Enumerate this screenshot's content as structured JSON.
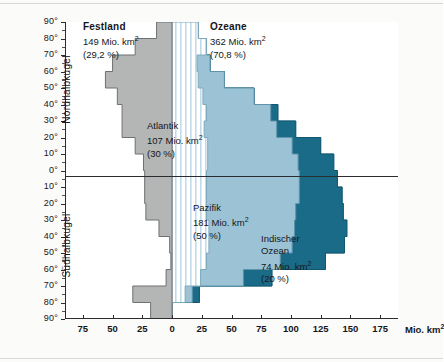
{
  "chart_data": {
    "type": "bar",
    "title": "",
    "orientation": "horizontal-back-to-back",
    "xlabel": "Mio. km2",
    "ylabel": "",
    "xlim": [
      -90,
      190
    ],
    "x_ticks": [
      {
        "value": -75,
        "label": "75"
      },
      {
        "value": -50,
        "label": "50"
      },
      {
        "value": -25,
        "label": "25"
      },
      {
        "value": 0,
        "label": "0"
      },
      {
        "value": 25,
        "label": "25"
      },
      {
        "value": 50,
        "label": "50"
      },
      {
        "value": 75,
        "label": "75"
      },
      {
        "value": 100,
        "label": "100"
      },
      {
        "value": 125,
        "label": "125"
      },
      {
        "value": 150,
        "label": "150"
      },
      {
        "value": 175,
        "label": "175"
      }
    ],
    "y_axis_label_unit": "degrees latitude",
    "y_ticks_north": [
      "90°",
      "80°",
      "70°",
      "60°",
      "50°",
      "40°",
      "30°",
      "20°",
      "10°",
      "0°"
    ],
    "y_ticks_south": [
      "10°",
      "20°",
      "30°",
      "40°",
      "50°",
      "60°",
      "70°",
      "80°",
      "90°"
    ],
    "bands": [
      {
        "lat_from": 90,
        "lat_to": 80,
        "land": 13,
        "atlantic": 22,
        "pacific": 0,
        "indian": 0
      },
      {
        "lat_from": 80,
        "lat_to": 70,
        "land": 31,
        "atlantic": 29,
        "pacific": 0,
        "indian": 0
      },
      {
        "lat_from": 70,
        "lat_to": 60,
        "land": 50,
        "atlantic": 21,
        "pacific": 11,
        "indian": 0
      },
      {
        "lat_from": 60,
        "lat_to": 50,
        "land": 56,
        "atlantic": 22,
        "pacific": 22,
        "indian": 0
      },
      {
        "lat_from": 50,
        "lat_to": 40,
        "land": 46,
        "atlantic": 26,
        "pacific": 43,
        "indian": 0
      },
      {
        "lat_from": 40,
        "lat_to": 30,
        "land": 42,
        "atlantic": 29,
        "pacific": 54,
        "indian": 6
      },
      {
        "lat_from": 30,
        "lat_to": 20,
        "land": 42,
        "atlantic": 27,
        "pacific": 61,
        "indian": 16
      },
      {
        "lat_from": 20,
        "lat_to": 10,
        "land": 31,
        "atlantic": 30,
        "pacific": 71,
        "indian": 24
      },
      {
        "lat_from": 10,
        "lat_to": 0,
        "land": 24,
        "atlantic": 30,
        "pacific": 76,
        "indian": 30
      },
      {
        "lat_from": 0,
        "lat_to": -10,
        "land": 23,
        "atlantic": 29,
        "pacific": 78,
        "indian": 32
      },
      {
        "lat_from": -10,
        "lat_to": -20,
        "land": 23,
        "atlantic": 29,
        "pacific": 78,
        "indian": 36
      },
      {
        "lat_from": -20,
        "lat_to": -30,
        "land": 22,
        "atlantic": 29,
        "pacific": 75,
        "indian": 40
      },
      {
        "lat_from": -30,
        "lat_to": -40,
        "land": 11,
        "atlantic": 31,
        "pacific": 72,
        "indian": 44
      },
      {
        "lat_from": -40,
        "lat_to": -50,
        "land": 2,
        "atlantic": 31,
        "pacific": 70,
        "indian": 44
      },
      {
        "lat_from": -50,
        "lat_to": -60,
        "land": 1,
        "atlantic": 29,
        "pacific": 62,
        "indian": 38
      },
      {
        "lat_from": -60,
        "lat_to": -70,
        "land": 5,
        "atlantic": 24,
        "pacific": 36,
        "indian": 24
      },
      {
        "lat_from": -70,
        "lat_to": -80,
        "land": 33,
        "atlantic": 11,
        "pacific": 6,
        "indian": 6
      },
      {
        "lat_from": -80,
        "lat_to": -90,
        "land": 18,
        "atlantic": 0,
        "pacific": 0,
        "indian": 0
      }
    ],
    "legend": [
      {
        "key": "land",
        "name": "Festland",
        "color": "#b4b5b5"
      },
      {
        "key": "atlantic",
        "name": "Atlantik",
        "color": "#eaf3f7"
      },
      {
        "key": "pacific",
        "name": "Pazifik",
        "color": "#9cc3d5"
      },
      {
        "key": "indian",
        "name": "Indischer Ozean",
        "color": "#1a6b87"
      }
    ]
  },
  "annotations": {
    "festland": {
      "title": "Festland",
      "area": "149 Mio. km",
      "area_sup": "2",
      "percent": "(29,2 %)"
    },
    "ozeane": {
      "title": "Ozeane",
      "area": "362 Mio. km",
      "area_sup": "2",
      "percent": "(70,8 %)"
    },
    "atlantik": {
      "title": "Atlantik",
      "area": "107 Mio. km",
      "area_sup": "2",
      "percent": "(30 %)"
    },
    "pazifik": {
      "title": "Pazifik",
      "area": "181 Mio. km",
      "area_sup": "2",
      "percent": "(50 %)"
    },
    "indik": {
      "title": "Indischer",
      "title2": "Ozean",
      "area": "74 Mio. km",
      "area_sup": "2",
      "percent": "(20 %)"
    }
  },
  "axes": {
    "hemisphere_north": "Nordhalbkugel",
    "hemisphere_south": "Südhalbkugel",
    "unit": "Mio. km",
    "unit_sup": "2"
  }
}
